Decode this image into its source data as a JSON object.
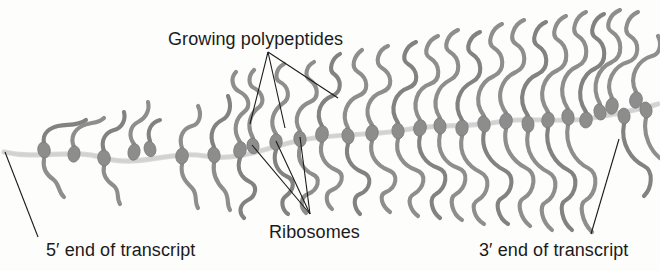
{
  "figure": {
    "kind": "polyribosome-diagram",
    "width": 660,
    "height": 271,
    "background_color": "#fdfdfc"
  },
  "labels": {
    "growing_polypeptides": "Growing polypeptides",
    "ribosomes": "Ribosomes",
    "five_prime_end": "5′ end of transcript",
    "three_prime_end": "3′ end of transcript"
  },
  "colors": {
    "polypeptide_stroke": "#8e8e8e",
    "polypeptide_stroke_dark": "#828282",
    "ribosome_fill": "#8d8d8d",
    "ribosome_stroke": "#7a7a7a",
    "mrna_stroke": "#d2d2d2",
    "mrna_stroke_edge": "#bdbdbd",
    "leader_line": "#1b1b1b",
    "text": "#1b1b1b"
  },
  "mrna": {
    "name": "mRNA transcript",
    "path": "M 4 152 C 40 160, 70 148, 104 158 C 140 168, 170 150, 205 156 C 240 162, 270 146, 302 140 C 338 133, 372 136, 404 130 C 440 123, 468 128, 498 122 C 528 116, 560 124, 592 118 C 616 114, 638 110, 658 104",
    "stroke_width": 3.2
  },
  "leader_lines": {
    "growing_polypeptides": {
      "anchor": [
        268,
        52
      ],
      "targets": [
        [
          250,
          124
        ],
        [
          285,
          128
        ],
        [
          338,
          98
        ]
      ]
    },
    "ribosomes": {
      "anchor": [
        310,
        214
      ],
      "targets": [
        [
          252,
          145
        ],
        [
          276,
          141
        ],
        [
          300,
          137
        ]
      ]
    },
    "five_prime": {
      "from": [
        5,
        152
      ],
      "to": [
        38,
        237
      ]
    },
    "three_prime": {
      "from": [
        619,
        139
      ],
      "to": [
        591,
        234
      ]
    }
  },
  "ribosomes": [
    {
      "cx": 44,
      "cy": 150,
      "rx": 6.2,
      "ry": 8.0,
      "rot": -12
    },
    {
      "cx": 74,
      "cy": 154,
      "rx": 6.0,
      "ry": 8.2,
      "rot": 8
    },
    {
      "cx": 104,
      "cy": 158,
      "rx": 6.3,
      "ry": 8.0,
      "rot": -6
    },
    {
      "cx": 134,
      "cy": 152,
      "rx": 6.0,
      "ry": 8.3,
      "rot": 10
    },
    {
      "cx": 150,
      "cy": 149,
      "rx": 5.8,
      "ry": 7.8,
      "rot": -14
    },
    {
      "cx": 182,
      "cy": 156,
      "rx": 6.3,
      "ry": 8.1,
      "rot": 6
    },
    {
      "cx": 214,
      "cy": 155,
      "rx": 6.1,
      "ry": 8.0,
      "rot": -8
    },
    {
      "cx": 240,
      "cy": 150,
      "rx": 6.2,
      "ry": 8.4,
      "rot": 12
    },
    {
      "cx": 253,
      "cy": 146,
      "rx": 6.0,
      "ry": 7.9,
      "rot": -10
    },
    {
      "cx": 276,
      "cy": 142,
      "rx": 6.2,
      "ry": 8.2,
      "rot": 5
    },
    {
      "cx": 300,
      "cy": 139,
      "rx": 6.1,
      "ry": 8.0,
      "rot": -7
    },
    {
      "cx": 322,
      "cy": 134,
      "rx": 6.3,
      "ry": 8.3,
      "rot": 9
    },
    {
      "cx": 348,
      "cy": 136,
      "rx": 6.0,
      "ry": 8.0,
      "rot": -11
    },
    {
      "cx": 372,
      "cy": 133,
      "rx": 6.2,
      "ry": 8.2,
      "rot": 7
    },
    {
      "cx": 398,
      "cy": 131,
      "rx": 6.1,
      "ry": 7.9,
      "rot": -5
    },
    {
      "cx": 420,
      "cy": 128,
      "rx": 6.3,
      "ry": 8.3,
      "rot": 11
    },
    {
      "cx": 440,
      "cy": 126,
      "rx": 6.0,
      "ry": 8.0,
      "rot": -9
    },
    {
      "cx": 462,
      "cy": 128,
      "rx": 6.2,
      "ry": 8.1,
      "rot": 6
    },
    {
      "cx": 484,
      "cy": 124,
      "rx": 6.1,
      "ry": 8.2,
      "rot": -12
    },
    {
      "cx": 506,
      "cy": 121,
      "rx": 6.3,
      "ry": 8.0,
      "rot": 8
    },
    {
      "cx": 528,
      "cy": 124,
      "rx": 6.0,
      "ry": 8.3,
      "rot": -6
    },
    {
      "cx": 548,
      "cy": 120,
      "rx": 6.2,
      "ry": 7.9,
      "rot": 10
    },
    {
      "cx": 568,
      "cy": 117,
      "rx": 6.1,
      "ry": 8.2,
      "rot": -8
    },
    {
      "cx": 586,
      "cy": 120,
      "rx": 6.3,
      "ry": 8.0,
      "rot": 7
    },
    {
      "cx": 600,
      "cy": 112,
      "rx": 6.0,
      "ry": 8.1,
      "rot": -13
    },
    {
      "cx": 612,
      "cy": 106,
      "rx": 6.2,
      "ry": 8.3,
      "rot": 9
    },
    {
      "cx": 624,
      "cy": 116,
      "rx": 6.1,
      "ry": 7.9,
      "rot": -5
    },
    {
      "cx": 636,
      "cy": 100,
      "rx": 6.3,
      "ry": 8.2,
      "rot": 11
    },
    {
      "cx": 646,
      "cy": 110,
      "rx": 6.0,
      "ry": 8.0,
      "rot": -10
    }
  ],
  "polypeptides": [
    "M 44 143 C 42 133, 50 128, 58 126 C 68 124, 78 126, 86 120",
    "M 44 159 C 42 170, 48 176, 54 180 C 60 185, 58 192, 64 197",
    "M 74 147 C 70 138, 74 130, 82 126 C 90 122, 98 124, 104 118",
    "M 104 151 C 100 140, 106 132, 114 130 C 122 128, 126 120, 124 112",
    "M 104 166 C 102 176, 108 182, 114 186 C 120 191, 116 198, 120 204",
    "M 134 144 C 128 136, 130 126, 138 122 C 146 118, 150 110, 148 102",
    "M 150 141 C 146 130, 152 122, 160 120",
    "M 182 148 C 178 136, 184 128, 192 126 C 200 124, 202 114, 198 106",
    "M 182 164 C 180 176, 186 182, 192 188 C 198 194, 194 202, 198 208",
    "M 214 147 C 208 134, 214 124, 222 120 C 230 116, 232 106, 228 96",
    "M 214 163 C 212 176, 218 184, 224 190 C 230 197, 226 204, 230 210",
    "M 240 142 C 232 130, 236 118, 244 112 C 252 106, 248 96, 240 92 C 232 88, 230 78, 236 72",
    "M 240 158 C 236 170, 242 178, 250 182 C 258 186, 256 196, 248 200 C 240 204, 238 212, 244 218",
    "M 253 138 C 246 126, 250 114, 258 108 C 266 102, 262 92, 254 88 C 248 85, 248 76, 254 70",
    "M 276 134 C 268 122, 274 110, 282 104 C 292 98, 288 86, 280 82 C 274 79, 276 68, 284 64",
    "M 276 150 C 272 162, 278 172, 286 176 C 296 180, 294 190, 286 196 C 280 200, 282 210, 288 214",
    "M 300 131 C 292 118, 300 106, 310 102 C 320 98, 318 86, 310 80 C 304 76, 306 66, 314 62",
    "M 300 147 C 296 160, 304 170, 312 174 C 322 178, 318 190, 308 194 C 300 197, 300 208, 306 213",
    "M 322 126 C 314 112, 322 100, 332 96 C 342 92, 342 80, 334 74 C 328 70, 332 58, 340 54",
    "M 322 142 C 318 156, 326 166, 336 170 C 346 174, 342 186, 332 190 C 324 193, 326 204, 332 209",
    "M 348 128 C 340 114, 348 100, 358 96 C 370 92, 368 78, 358 72 C 350 67, 354 56, 362 50",
    "M 348 144 C 344 158, 352 168, 362 172 C 374 176, 370 190, 360 194 C 352 197, 354 208, 360 214",
    "M 372 125 C 362 110, 370 96, 382 92 C 394 88, 392 74, 382 68 C 374 63, 378 50, 388 46",
    "M 372 141 C 368 156, 378 166, 388 170 C 400 174, 396 188, 386 192 C 378 195, 382 206, 390 212",
    "M 398 123 C 388 108, 396 92, 408 88 C 420 84, 418 70, 408 64 C 400 59, 406 46, 416 42",
    "M 398 139 C 394 154, 404 166, 416 170 C 428 174, 424 188, 414 194 C 406 198, 410 210, 418 216",
    "M 420 120 C 410 104, 418 88, 430 84 C 442 80, 440 64, 430 58 C 422 53, 428 40, 438 36",
    "M 420 136 C 416 152, 426 164, 438 168 C 450 172, 446 188, 436 194 C 428 198, 432 212, 440 218",
    "M 440 118 C 430 102, 438 86, 450 80 C 462 74, 460 58, 450 52 C 442 47, 448 34, 458 30",
    "M 440 134 C 436 152, 446 164, 458 168 C 470 172, 466 188, 456 194 C 448 198, 452 214, 462 220",
    "M 462 120 C 452 104, 460 88, 472 82 C 484 76, 482 60, 472 54 C 464 49, 470 36, 480 32",
    "M 462 136 C 458 154, 468 166, 480 172 C 492 178, 488 194, 478 200 C 470 204, 474 218, 484 224",
    "M 484 116 C 472 100, 480 82, 494 76 C 506 70, 504 54, 494 48 C 486 43, 492 28, 502 24",
    "M 484 132 C 480 150, 492 164, 504 170 C 516 176, 512 192, 502 198 C 494 202, 498 218, 508 224",
    "M 506 113 C 494 96, 502 78, 516 72 C 528 66, 526 50, 516 44 C 508 39, 514 24, 524 20",
    "M 506 129 C 502 148, 514 162, 526 168 C 538 174, 534 192, 524 198 C 516 202, 520 218, 530 226",
    "M 528 116 C 516 98, 524 80, 538 74 C 550 68, 548 52, 538 46 C 530 41, 536 26, 546 22",
    "M 528 132 C 524 152, 536 166, 548 172 C 560 178, 556 196, 546 202 C 538 206, 542 222, 552 230",
    "M 548 112 C 536 94, 544 76, 558 70 C 570 64, 568 46, 558 40 C 550 35, 556 20, 566 16",
    "M 548 128 C 544 148, 556 164, 568 170 C 580 176, 576 194, 566 200 C 558 204, 562 222, 572 230",
    "M 568 109 C 556 90, 564 72, 578 66 C 590 60, 588 42, 578 36 C 570 31, 576 16, 586 12",
    "M 568 125 C 564 146, 576 162, 588 168 C 600 174, 596 194, 586 200 C 578 204, 582 222, 592 232",
    "M 586 112 C 574 94, 582 74, 596 68 C 608 62, 606 44, 596 38 C 588 33, 594 18, 604 14",
    "M 600 104 C 590 86, 598 68, 612 62 C 624 56, 622 38, 612 32 C 604 27, 610 14, 620 10",
    "M 612 98 C 604 82, 614 66, 628 62 C 640 58, 640 42, 630 36 C 622 31, 628 16, 638 12",
    "M 624 124 C 620 144, 632 160, 644 166 C 654 171, 652 188, 644 196",
    "M 636 92 C 628 76, 638 60, 652 56 C 660 54, 662 44, 658 36",
    "M 646 118 C 642 136, 652 152, 660 158"
  ]
}
